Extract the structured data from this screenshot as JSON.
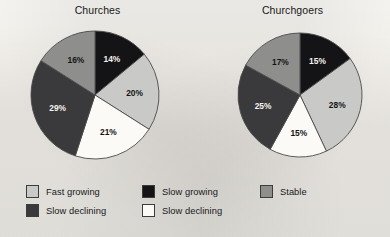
{
  "palette": {
    "fast_growing": "#c9c9c7",
    "slow_declining_dark": "#3a3a3c",
    "slow_growing": "#141416",
    "slow_declining_white": "#fbfaf7",
    "stable": "#8e8e8d",
    "outline": "#4a4a4a",
    "paper": "#f2f0ec",
    "text": "#1b1b1b"
  },
  "chart_data": [
    {
      "type": "pie",
      "title": "Churches",
      "categories": [
        "Slow growing",
        "Fast growing",
        "Slow declining",
        "Slow declining",
        "Stable"
      ],
      "values": [
        14,
        20,
        21,
        29,
        16
      ],
      "labels": [
        "14%",
        "20%",
        "21%",
        "29%",
        "16%"
      ],
      "colors": [
        "#141416",
        "#c9c9c7",
        "#fbfaf7",
        "#3a3a3c",
        "#8e8e8d"
      ],
      "label_colors": [
        "light",
        "dark",
        "dark",
        "light",
        "dark"
      ],
      "start_angle_deg": 0,
      "legend_position": "bottom",
      "grid": false,
      "xlabel": "",
      "ylabel": ""
    },
    {
      "type": "pie",
      "title": "Churchgoers",
      "categories": [
        "Slow growing",
        "Fast growing",
        "Slow declining",
        "Slow declining",
        "Stable"
      ],
      "values": [
        15,
        28,
        15,
        25,
        17
      ],
      "labels": [
        "15%",
        "28%",
        "15%",
        "25%",
        "17%"
      ],
      "colors": [
        "#141416",
        "#c9c9c7",
        "#fbfaf7",
        "#3a3a3c",
        "#8e8e8d"
      ],
      "label_colors": [
        "light",
        "dark",
        "dark",
        "light",
        "dark"
      ],
      "start_angle_deg": 0,
      "legend_position": "bottom",
      "grid": false,
      "xlabel": "",
      "ylabel": ""
    }
  ],
  "charts": {
    "churches": {
      "title": "Churches",
      "slices": [
        {
          "label": "14%",
          "value": 14,
          "category": "Slow growing",
          "color": "#141416",
          "label_fill": "light"
        },
        {
          "label": "20%",
          "value": 20,
          "category": "Fast growing",
          "color": "#c9c9c7",
          "label_fill": "dark"
        },
        {
          "label": "21%",
          "value": 21,
          "category": "Slow declining",
          "color": "#fbfaf7",
          "label_fill": "dark"
        },
        {
          "label": "29%",
          "value": 29,
          "category": "Slow declining",
          "color": "#3a3a3c",
          "label_fill": "light"
        },
        {
          "label": "16%",
          "value": 16,
          "category": "Stable",
          "color": "#8e8e8d",
          "label_fill": "dark"
        }
      ]
    },
    "churchgoers": {
      "title": "Churchgoers",
      "slices": [
        {
          "label": "15%",
          "value": 15,
          "category": "Slow growing",
          "color": "#141416",
          "label_fill": "light"
        },
        {
          "label": "28%",
          "value": 28,
          "category": "Fast growing",
          "color": "#c9c9c7",
          "label_fill": "dark"
        },
        {
          "label": "15%",
          "value": 15,
          "category": "Slow declining",
          "color": "#fbfaf7",
          "label_fill": "dark"
        },
        {
          "label": "25%",
          "value": 25,
          "category": "Slow declining",
          "color": "#3a3a3c",
          "label_fill": "light"
        },
        {
          "label": "17%",
          "value": 17,
          "category": "Stable",
          "color": "#8e8e8d",
          "label_fill": "dark"
        }
      ]
    }
  },
  "legend": {
    "columns": [
      {
        "items": [
          {
            "label": "Fast growing",
            "color": "#c9c9c7"
          },
          {
            "label": "Slow declining",
            "color": "#3a3a3c"
          }
        ]
      },
      {
        "items": [
          {
            "label": "Slow growing",
            "color": "#141416"
          },
          {
            "label": "Slow declining",
            "color": "#fbfaf7"
          }
        ]
      },
      {
        "items": [
          {
            "label": "Stable",
            "color": "#8e8e8d"
          }
        ]
      }
    ]
  }
}
